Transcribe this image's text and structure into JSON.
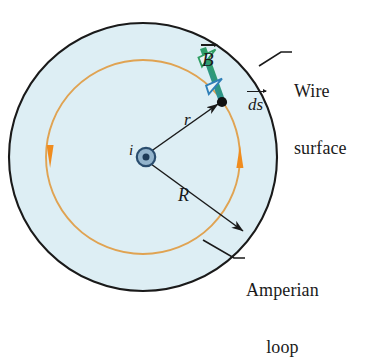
{
  "figure": {
    "colors": {
      "wire_fill": "#ddeef4",
      "wire_edge": "#1a1a1a",
      "amperian_loop": "#e8a33d",
      "amperian_arrowhead": "#f08c1e",
      "B_vector_start": "#2f9e63",
      "B_vector_end": "#2f7fb8",
      "ds_arrowhead": "#2f7fb8",
      "current_symbol": "#2a4d6e",
      "leader_line": "#1a1a1a",
      "label_text": "#1a1a1a"
    },
    "geometry": {
      "center_x": 143,
      "center_y": 157,
      "wire_radius": 134,
      "amperian_radius": 97,
      "point_angle_deg": 52
    }
  },
  "labels": {
    "B_field": "B",
    "line_element": "ds",
    "radius_small": "r",
    "radius_large": "R",
    "current": "i",
    "wire_surface_line1": "Wire",
    "wire_surface_line2": "surface",
    "amperian_line1": "Amperian",
    "amperian_line2": "loop"
  },
  "annotations": {
    "current_direction": "out of page",
    "loop_circulation": "counterclockwise",
    "B_vector_direction": "tangent to Amperian loop",
    "ds_direction": "tangent to Amperian loop"
  }
}
